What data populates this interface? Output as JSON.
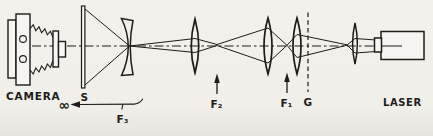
{
  "colors": {
    "ink": "#1d1c1a",
    "paper": "#f1efe9"
  },
  "diagram": {
    "camera": {
      "label": "CAMERA"
    },
    "screen": {
      "label": "S"
    },
    "grating": {
      "label": "G"
    },
    "laser": {
      "label": "LASER"
    },
    "focal_marks": {
      "f1": {
        "label": "F₁"
      },
      "f2": {
        "label": "F₂"
      },
      "f3": {
        "label": "F₃"
      }
    },
    "infinity": {
      "label": "∞"
    }
  }
}
